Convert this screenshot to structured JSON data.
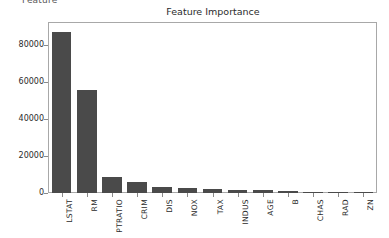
{
  "figure": {
    "clipped_top_text": "Feature",
    "background_color": "#ffffff",
    "bar_color": "#4a4a4a",
    "axis_color": "#a8a8a8",
    "text_color": "#2b2b2b"
  },
  "chart_data": {
    "type": "bar",
    "title": "Feature Importance",
    "xlabel": "",
    "ylabel": "",
    "categories": [
      "LSTAT",
      "RM",
      "PTRATIO",
      "CRIM",
      "DIS",
      "NOX",
      "TAX",
      "INDUS",
      "AGE",
      "B",
      "CHAS",
      "RAD",
      "ZN"
    ],
    "values": [
      87000,
      55500,
      8500,
      6000,
      3500,
      2700,
      2100,
      1700,
      1500,
      1300,
      400,
      350,
      150
    ],
    "ylim": [
      0,
      92000
    ],
    "ytick_labels": [
      "0",
      "20000",
      "40000",
      "60000",
      "80000"
    ],
    "ytick_values": [
      0,
      20000,
      40000,
      60000,
      80000
    ],
    "grid": false,
    "legend": null
  }
}
